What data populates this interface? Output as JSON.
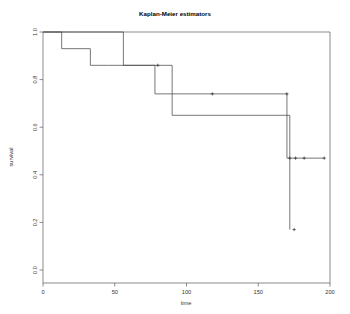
{
  "chart_data": {
    "type": "line",
    "title": "Kaplan-Meier estimators",
    "xlabel": "time",
    "ylabel": "survival",
    "xlim": [
      0,
      200
    ],
    "ylim": [
      0.0,
      1.0
    ],
    "grid": false,
    "legend": null,
    "xticks": [
      0,
      50,
      100,
      150,
      200
    ],
    "xtick_labels": [
      "0",
      "50",
      "100",
      "150",
      "200"
    ],
    "yticks": [
      0.0,
      0.2,
      0.4,
      0.6,
      0.8,
      1.0
    ],
    "ytick_labels": [
      "0.0",
      "0.2",
      "0.4",
      "0.6",
      "0.8",
      "1.0"
    ],
    "step_style": "post",
    "series": [
      {
        "name": "group-1",
        "x": [
          0,
          13,
          13,
          33,
          33,
          45,
          45,
          90,
          90,
          172,
          172,
          172
        ],
        "values": [
          1.0,
          1.0,
          0.93,
          0.93,
          0.86,
          0.86,
          0.86,
          0.86,
          0.65,
          0.65,
          0.65,
          0.17
        ],
        "censor_x": [
          80,
          175
        ],
        "censor_y": [
          0.86,
          0.17
        ]
      },
      {
        "name": "group-2",
        "x": [
          0,
          22,
          22,
          56,
          56,
          78,
          78,
          170,
          170,
          196
        ],
        "values": [
          1.0,
          1.0,
          1.0,
          1.0,
          0.86,
          0.86,
          0.74,
          0.74,
          0.47,
          0.47
        ],
        "censor_x": [
          118,
          170,
          172,
          176,
          182,
          196
        ],
        "censor_y": [
          0.74,
          0.74,
          0.47,
          0.47,
          0.47,
          0.47
        ]
      }
    ],
    "annotations": []
  }
}
